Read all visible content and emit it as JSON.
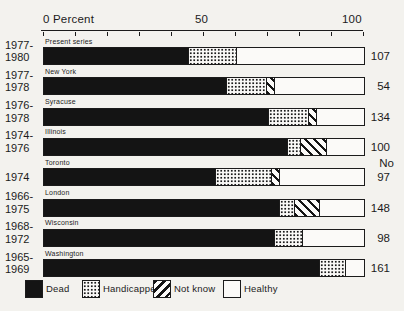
{
  "axis": {
    "label_zero": "0 Percent",
    "label_mid": "50",
    "label_max": "100",
    "tick_step": 10
  },
  "n_column_header": "No",
  "legend": [
    {
      "key": "dead",
      "label": "Dead"
    },
    {
      "key": "handicapped",
      "label": "Handicapped"
    },
    {
      "key": "not_know",
      "label": "Not know"
    },
    {
      "key": "healthy",
      "label": "Healthy"
    }
  ],
  "chart_data": {
    "type": "bar",
    "stacked": true,
    "orientation": "horizontal",
    "unit": "percent",
    "xlim": [
      0,
      100
    ],
    "series_keys": [
      "dead",
      "handicapped",
      "not_know",
      "healthy"
    ],
    "colors": {
      "dead": "#141414",
      "handicapped": "dotted-pattern",
      "not_know": "diagonal-hatch",
      "healthy": "#ffffff",
      "paper": "#f3f2ee",
      "ink": "#1b1b1b"
    },
    "rows": [
      {
        "years": "1977-1980",
        "study": "Present series",
        "n": 107,
        "dead": 45,
        "handicapped": 15,
        "not_know": 0,
        "healthy": 40
      },
      {
        "years": "1977-1978",
        "study": "New York",
        "n": 54,
        "dead": 57,
        "handicapped": 12.5,
        "not_know": 2.5,
        "healthy": 28
      },
      {
        "years": "1976-1978",
        "study": "Syracuse",
        "n": 134,
        "dead": 70,
        "handicapped": 12.5,
        "not_know": 2.5,
        "healthy": 15
      },
      {
        "years": "1974-1976",
        "study": "Illinois",
        "n": 100,
        "dead": 76,
        "handicapped": 4,
        "not_know": 8,
        "healthy": 12
      },
      {
        "years": "1974",
        "study": "Toronto",
        "n": 97,
        "dead": 53.5,
        "handicapped": 17.5,
        "not_know": 2.5,
        "healthy": 26.5
      },
      {
        "years": "1966-1975",
        "study": "London",
        "n": 148,
        "dead": 73.5,
        "handicapped": 4.5,
        "not_know": 8,
        "healthy": 14
      },
      {
        "years": "1968-1972",
        "study": "Wisconsin",
        "n": 98,
        "dead": 72,
        "handicapped": 8.5,
        "not_know": 0,
        "healthy": 19.5
      },
      {
        "years": "1965-1969",
        "study": "Washington",
        "n": 161,
        "dead": 86,
        "handicapped": 8,
        "not_know": 0,
        "healthy": 6
      }
    ]
  }
}
